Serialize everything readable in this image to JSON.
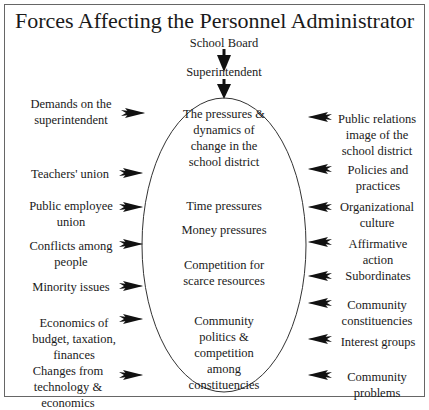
{
  "title": "Forces Affecting the Personnel Administrator",
  "top": {
    "board": "School Board",
    "superintendent": "Superintendent"
  },
  "center": {
    "items": [
      "The pressures & dynamics of change in the school district",
      "Time pressures",
      "Money pressures",
      "Competition for scarce resources",
      "Community politics & competition among constituencies"
    ]
  },
  "left": {
    "items": [
      "Demands on the superintendent",
      "Teachers' union",
      "Public employee union",
      "Conflicts among people",
      "Minority issues",
      "Economics of budget, taxation, finances",
      "Changes from technology & economics"
    ]
  },
  "right": {
    "items": [
      "Public relations image of the school district",
      "Policies and practices",
      "Organizational culture",
      "Affirmative action",
      "Subordinates",
      "Community constituencies",
      "Interest groups",
      "Community problems"
    ]
  }
}
